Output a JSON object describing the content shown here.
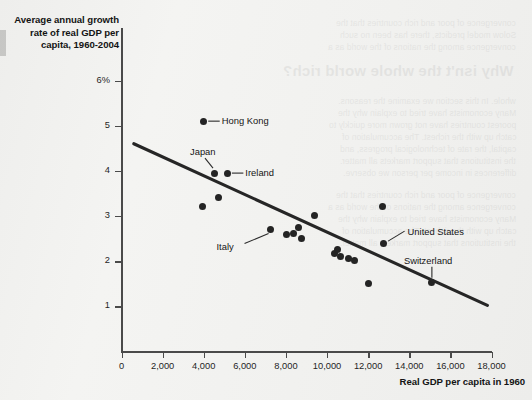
{
  "figure": {
    "y_axis_title": "Average annual growth rate of real GDP per capita, 1960-2004",
    "x_axis_title": "Real GDP per capita in 1960"
  },
  "bleed_through": {
    "heading": "Why isn't the whole world rich?",
    "lines": [
      "convergence of poor and rich countries that the",
      "Solow model predicts, there has been no such",
      "convergence among the nations of the world as a",
      "whole. In this section we examine the reasons.",
      "Many economists have tried to explain why the",
      "poorest countries have not grown more quickly to",
      "catch up with the richest. The accumulation of",
      "capital, the rate of technological progress, and",
      "the institutions that support markets all matter.",
      "differences in income per person we observe."
    ]
  },
  "chart_data": {
    "type": "scatter",
    "title": "",
    "xlabel": "Real GDP per capita in 1960",
    "ylabel": "Average annual growth rate of real GDP per capita, 1960-2004",
    "xlim": [
      0,
      18000
    ],
    "ylim": [
      0,
      6
    ],
    "x_ticks": [
      0,
      2000,
      4000,
      6000,
      8000,
      10000,
      12000,
      14000,
      16000,
      18000
    ],
    "x_tick_labels": [
      "0",
      "2,000",
      "4,000",
      "6,000",
      "8,000",
      "10,000",
      "12,000",
      "14,000",
      "16,000",
      "18,000"
    ],
    "y_ticks": [
      1,
      2,
      3,
      4,
      5,
      6
    ],
    "y_tick_labels": [
      "1",
      "2",
      "3",
      "4",
      "5",
      "6%"
    ],
    "grid": false,
    "legend": null,
    "points": [
      {
        "name": "Hong Kong",
        "x": 4000,
        "y": 5.1,
        "labeled": true
      },
      {
        "name": "Japan",
        "x": 4500,
        "y": 3.95,
        "labeled": true
      },
      {
        "name": "Ireland",
        "x": 5150,
        "y": 3.95,
        "labeled": true
      },
      {
        "name": "",
        "x": 3950,
        "y": 3.2,
        "labeled": false
      },
      {
        "name": "",
        "x": 4700,
        "y": 3.4,
        "labeled": false
      },
      {
        "name": "Italy",
        "x": 7250,
        "y": 2.7,
        "labeled": true
      },
      {
        "name": "",
        "x": 8050,
        "y": 2.6,
        "labeled": false
      },
      {
        "name": "",
        "x": 8350,
        "y": 2.62,
        "labeled": false
      },
      {
        "name": "",
        "x": 8600,
        "y": 2.75,
        "labeled": false
      },
      {
        "name": "",
        "x": 8750,
        "y": 2.5,
        "labeled": false
      },
      {
        "name": "",
        "x": 9400,
        "y": 3.02,
        "labeled": false
      },
      {
        "name": "",
        "x": 10350,
        "y": 2.18,
        "labeled": false
      },
      {
        "name": "",
        "x": 10500,
        "y": 2.25,
        "labeled": false
      },
      {
        "name": "",
        "x": 10650,
        "y": 2.1,
        "labeled": false
      },
      {
        "name": "",
        "x": 11050,
        "y": 2.05,
        "labeled": false
      },
      {
        "name": "",
        "x": 11350,
        "y": 2.02,
        "labeled": false
      },
      {
        "name": "",
        "x": 12000,
        "y": 1.5,
        "labeled": false
      },
      {
        "name": "",
        "x": 12700,
        "y": 3.2,
        "labeled": false
      },
      {
        "name": "United States",
        "x": 12750,
        "y": 2.4,
        "labeled": true
      },
      {
        "name": "Switzerland",
        "x": 15100,
        "y": 1.52,
        "labeled": true
      }
    ],
    "trend_line": {
      "style": "solid",
      "x_start": 600,
      "y_start": 4.6,
      "x_end": 17800,
      "y_end": 1.02
    },
    "annotations": [
      {
        "text": "Hong Kong",
        "side": "right"
      },
      {
        "text": "Japan",
        "side": "above"
      },
      {
        "text": "Ireland",
        "side": "right"
      },
      {
        "text": "Italy",
        "side": "left"
      },
      {
        "text": "United States",
        "side": "right"
      },
      {
        "text": "Switzerland",
        "side": "above"
      }
    ]
  }
}
